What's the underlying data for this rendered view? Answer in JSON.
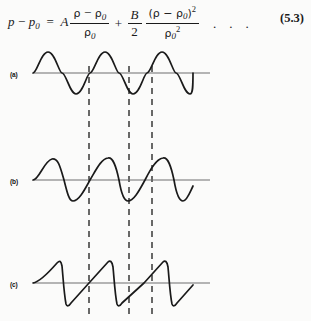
{
  "page": {
    "kind": "textbook-page-excerpt",
    "background_color": "#fbfbfa",
    "ink_color": "#1a1a1a"
  },
  "equation": {
    "number": "(5.3)",
    "lhs_variable": "p",
    "minus": "−",
    "lhs_sub": "0",
    "equals": "=",
    "coefficient_A": "A",
    "first_term_numerator_rho": "ρ",
    "first_term_numerator_minus": "−",
    "first_term_numerator_rho0": "ρ",
    "first_term_numerator_rho0_sub": "0",
    "first_term_denominator_rho": "ρ",
    "first_term_denominator_sub": "0",
    "plus": "+",
    "coefficient_B": "B",
    "coefficient_B_denominator": "2",
    "second_term_numerator": "(ρ − ρ",
    "second_term_numerator_sub": "0",
    "second_term_numerator_close": ")",
    "second_term_numerator_power": "2",
    "second_term_denominator_rho": "ρ",
    "second_term_denominator_sub": "0",
    "second_term_denominator_power": "2",
    "trailing_dots": [
      ".",
      ".",
      "."
    ],
    "plain_text": "p − p₀ = A (ρ − ρ₀)/ρ₀ + (B/2) (ρ − ρ₀)²/ρ₀²   . . .   (5.3)"
  },
  "figure": {
    "panels": [
      {
        "label": "(a)",
        "waveform": "sine",
        "description": "undistorted sinusoidal pressure wave",
        "baseline_y": 27,
        "amplitude": 21,
        "cycles": 3
      },
      {
        "label": "(b)",
        "waveform": "distorted-sine",
        "description": "partially distorted wave, steepening compressive front",
        "baseline_y": 134,
        "amplitude": 21,
        "cycles": 3
      },
      {
        "label": "(c)",
        "waveform": "sawtooth",
        "description": "fully developed sawtooth shock wave",
        "baseline_y": 237,
        "amplitude": 21,
        "cycles": 3
      }
    ],
    "axis": {
      "x_start": 33,
      "x_end": 210,
      "wave_start": 33,
      "wave_end": 192
    },
    "dashed_guide_lines": [
      {
        "x": 89,
        "y_top": 20,
        "y_bottom": 275
      },
      {
        "x": 129,
        "y_top": 20,
        "y_bottom": 275
      },
      {
        "x": 152,
        "y_top": 20,
        "y_bottom": 275
      }
    ],
    "stroke_color": "#1a1a1a",
    "baseline_color": "#6e6e6e"
  }
}
